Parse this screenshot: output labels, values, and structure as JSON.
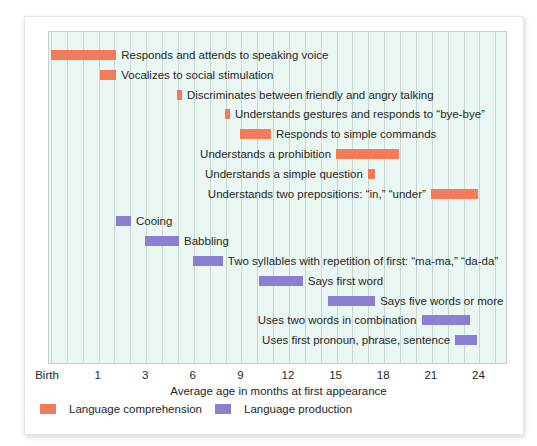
{
  "colors": {
    "comprehension": "#f47a5a",
    "production": "#8a7fd0",
    "plot_background": "#eaf7f3",
    "gridline": "#c8d6d1"
  },
  "axis": {
    "xlabel": "Average age in months at first appearance",
    "ticks": [
      "Birth",
      "1",
      "3",
      "6",
      "9",
      "12",
      "15",
      "18",
      "21",
      "24"
    ]
  },
  "legend": {
    "comprehension": "Language comprehension",
    "production": "Language production"
  },
  "bars": [
    {
      "label": "Responds and attends to speaking voice",
      "series": "comprehension",
      "start_u": 0.0,
      "end_u": 1.37,
      "label_side": "right"
    },
    {
      "label": "Vocalizes to social stimulation",
      "series": "comprehension",
      "start_u": 1.03,
      "end_u": 1.37,
      "label_side": "right"
    },
    {
      "label": "Discriminates between friendly and angry talking",
      "series": "comprehension",
      "start_u": 2.65,
      "end_u": 2.75,
      "label_side": "right"
    },
    {
      "label": "Understands gestures and responds to “bye-bye”",
      "series": "comprehension",
      "start_u": 3.66,
      "end_u": 3.76,
      "label_side": "right"
    },
    {
      "label": "Responds to simple commands",
      "series": "comprehension",
      "start_u": 3.97,
      "end_u": 4.62,
      "label_side": "right"
    },
    {
      "label": "Understands a prohibition",
      "series": "comprehension",
      "start_u": 5.99,
      "end_u": 7.31,
      "label_side": "left"
    },
    {
      "label": "Understands a simple question",
      "series": "comprehension",
      "start_u": 6.66,
      "end_u": 6.81,
      "label_side": "left"
    },
    {
      "label": "Understands two prepositions: “in,” “under”",
      "series": "comprehension",
      "start_u": 7.98,
      "end_u": 8.97,
      "label_side": "left"
    },
    {
      "label": "Cooing",
      "series": "production",
      "start_u": 1.37,
      "end_u": 1.68,
      "label_side": "right"
    },
    {
      "label": "Babbling",
      "series": "production",
      "start_u": 1.97,
      "end_u": 2.69,
      "label_side": "right"
    },
    {
      "label": "Two syllables with repetition of first: “ma-ma,” “da-da”",
      "series": "production",
      "start_u": 2.98,
      "end_u": 3.61,
      "label_side": "right"
    },
    {
      "label": "Says first word",
      "series": "production",
      "start_u": 4.37,
      "end_u": 5.29,
      "label_side": "right"
    },
    {
      "label": "Says five words or more",
      "series": "production",
      "start_u": 5.82,
      "end_u": 6.81,
      "label_side": "right"
    },
    {
      "label": "Uses two words in combination",
      "series": "production",
      "start_u": 7.79,
      "end_u": 8.8,
      "label_side": "left"
    },
    {
      "label": "Uses first pronoun, phrase, sentence",
      "series": "production",
      "start_u": 8.49,
      "end_u": 8.95,
      "label_side": "left"
    }
  ],
  "chart_data": {
    "type": "bar",
    "orientation": "horizontal-range (gantt)",
    "title": "",
    "xlabel": "Average age in months at first appearance",
    "ylabel": "",
    "x_tick_labels": [
      "Birth",
      "1",
      "3",
      "6",
      "9",
      "12",
      "15",
      "18",
      "21",
      "24"
    ],
    "x_tick_values_months": [
      0,
      1,
      3,
      6,
      9,
      12,
      15,
      18,
      21,
      24
    ],
    "x_scale_note": "Ticks equally spaced but non-linear in months",
    "xlim_months": [
      0,
      26
    ],
    "grid": "vertical gridlines, 3 per tick interval",
    "legend": [
      "Language comprehension",
      "Language production"
    ],
    "legend_position": "bottom-left",
    "series": [
      {
        "name": "Language comprehension",
        "color": "#f47a5a",
        "items": [
          {
            "milestone": "Responds and attends to speaking voice",
            "start_month": 0,
            "end_month": 1.7
          },
          {
            "milestone": "Vocalizes to social stimulation",
            "start_month": 1.1,
            "end_month": 1.7
          },
          {
            "milestone": "Discriminates between friendly and angry talking",
            "start_month": 5.0,
            "end_month": 5.2
          },
          {
            "milestone": "Understands gestures and responds to “bye-bye”",
            "start_month": 8.0,
            "end_month": 8.3
          },
          {
            "milestone": "Responds to simple commands",
            "start_month": 8.9,
            "end_month": 10.9
          },
          {
            "milestone": "Understands a prohibition",
            "start_month": 15.0,
            "end_month": 18.9
          },
          {
            "milestone": "Understands a simple question",
            "start_month": 17.0,
            "end_month": 17.4
          },
          {
            "milestone": "Understands two prepositions: “in,” “under”",
            "start_month": 20.9,
            "end_month": 23.9
          }
        ]
      },
      {
        "name": "Language production",
        "color": "#8a7fd0",
        "items": [
          {
            "milestone": "Cooing",
            "start_month": 1.7,
            "end_month": 2.4
          },
          {
            "milestone": "Babbling",
            "start_month": 2.9,
            "end_month": 5.1
          },
          {
            "milestone": "Two syllables with repetition of first: “ma-ma,” “da-da”",
            "start_month": 5.9,
            "end_month": 7.8
          },
          {
            "milestone": "Says first word",
            "start_month": 10.1,
            "end_month": 12.9
          },
          {
            "milestone": "Says five words or more",
            "start_month": 14.5,
            "end_month": 17.4
          },
          {
            "milestone": "Uses two words in combination",
            "start_month": 20.4,
            "end_month": 23.4
          },
          {
            "milestone": "Uses first pronoun, phrase, sentence",
            "start_month": 22.5,
            "end_month": 23.9
          }
        ]
      }
    ]
  }
}
